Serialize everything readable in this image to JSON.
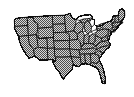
{
  "figure": {
    "title": "United States map",
    "caption": "",
    "width": 134,
    "height": 97
  },
  "style": {
    "background_color": "#ffffff",
    "fill_pattern": "checkerboard-dither-50",
    "fill_dark_color": "#4d4d4d",
    "fill_light_color": "#d8d8d8",
    "state_border_color": "#141414",
    "national_outline_color": "#0d0d0d",
    "lake_color": "#ffffff"
  },
  "map_content": {
    "type": "choropleth-outline",
    "projection": "albers-like",
    "region_count": 49,
    "includes_state_borders": true,
    "includes_great_lakes": true,
    "regions": [
      {
        "name": "Washington",
        "abbr": "WA"
      },
      {
        "name": "Oregon",
        "abbr": "OR"
      },
      {
        "name": "California",
        "abbr": "CA"
      },
      {
        "name": "Nevada",
        "abbr": "NV"
      },
      {
        "name": "Idaho",
        "abbr": "ID"
      },
      {
        "name": "Montana",
        "abbr": "MT"
      },
      {
        "name": "Wyoming",
        "abbr": "WY"
      },
      {
        "name": "Utah",
        "abbr": "UT"
      },
      {
        "name": "Arizona",
        "abbr": "AZ"
      },
      {
        "name": "Colorado",
        "abbr": "CO"
      },
      {
        "name": "New Mexico",
        "abbr": "NM"
      },
      {
        "name": "North Dakota",
        "abbr": "ND"
      },
      {
        "name": "South Dakota",
        "abbr": "SD"
      },
      {
        "name": "Nebraska",
        "abbr": "NE"
      },
      {
        "name": "Kansas",
        "abbr": "KS"
      },
      {
        "name": "Oklahoma",
        "abbr": "OK"
      },
      {
        "name": "Texas",
        "abbr": "TX"
      },
      {
        "name": "Minnesota",
        "abbr": "MN"
      },
      {
        "name": "Iowa",
        "abbr": "IA"
      },
      {
        "name": "Missouri",
        "abbr": "MO"
      },
      {
        "name": "Arkansas",
        "abbr": "AR"
      },
      {
        "name": "Louisiana",
        "abbr": "LA"
      },
      {
        "name": "Wisconsin",
        "abbr": "WI"
      },
      {
        "name": "Illinois",
        "abbr": "IL"
      },
      {
        "name": "Michigan",
        "abbr": "MI"
      },
      {
        "name": "Indiana",
        "abbr": "IN"
      },
      {
        "name": "Ohio",
        "abbr": "OH"
      },
      {
        "name": "Kentucky",
        "abbr": "KY"
      },
      {
        "name": "Tennessee",
        "abbr": "TN"
      },
      {
        "name": "Mississippi",
        "abbr": "MS"
      },
      {
        "name": "Alabama",
        "abbr": "AL"
      },
      {
        "name": "Georgia",
        "abbr": "GA"
      },
      {
        "name": "Florida",
        "abbr": "FL"
      },
      {
        "name": "South Carolina",
        "abbr": "SC"
      },
      {
        "name": "North Carolina",
        "abbr": "NC"
      },
      {
        "name": "Virginia",
        "abbr": "VA"
      },
      {
        "name": "West Virginia",
        "abbr": "WV"
      },
      {
        "name": "Maryland",
        "abbr": "MD"
      },
      {
        "name": "Delaware",
        "abbr": "DE"
      },
      {
        "name": "Pennsylvania",
        "abbr": "PA"
      },
      {
        "name": "New Jersey",
        "abbr": "NJ"
      },
      {
        "name": "New York",
        "abbr": "NY"
      },
      {
        "name": "Connecticut",
        "abbr": "CT"
      },
      {
        "name": "Rhode Island",
        "abbr": "RI"
      },
      {
        "name": "Massachusetts",
        "abbr": "MA"
      },
      {
        "name": "Vermont",
        "abbr": "VT"
      },
      {
        "name": "New Hampshire",
        "abbr": "NH"
      },
      {
        "name": "Maine",
        "abbr": "ME"
      }
    ],
    "water_bodies": [
      {
        "name": "Lake Superior"
      },
      {
        "name": "Lake Michigan"
      },
      {
        "name": "Lake Huron"
      },
      {
        "name": "Lake Erie"
      },
      {
        "name": "Lake Ontario"
      }
    ]
  }
}
